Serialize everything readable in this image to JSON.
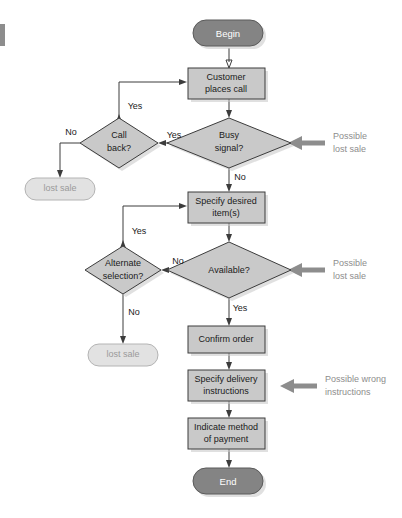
{
  "diagram": {
    "colors": {
      "process_fill": "#c9c9c9",
      "terminator_fill": "#848484",
      "lost_fill": "#e2e2e2",
      "line": "#3c3c3c",
      "annotation": "#8d8d8d"
    },
    "nodes": {
      "begin": {
        "label": "Begin",
        "type": "terminator"
      },
      "customer_places_call": {
        "label_line1": "Customer",
        "label_line2": "places call",
        "type": "process"
      },
      "busy_signal": {
        "label_line1": "Busy",
        "label_line2": "signal?",
        "type": "decision"
      },
      "call_back": {
        "label_line1": "Call",
        "label_line2": "back?",
        "type": "decision"
      },
      "lost_sale_1": {
        "label": "lost sale",
        "type": "terminator-light"
      },
      "specify_desired_items": {
        "label_line1": "Specify desired",
        "label_line2": "item(s)",
        "type": "process"
      },
      "available": {
        "label": "Available?",
        "type": "decision"
      },
      "alternate_selection": {
        "label_line1": "Alternate",
        "label_line2": "selection?",
        "type": "decision"
      },
      "lost_sale_2": {
        "label": "lost sale",
        "type": "terminator-light"
      },
      "confirm_order": {
        "label": "Confirm order",
        "type": "process"
      },
      "specify_delivery": {
        "label_line1": "Specify delivery",
        "label_line2": "instructions",
        "type": "process"
      },
      "indicate_payment": {
        "label_line1": "Indicate method",
        "label_line2": "of payment",
        "type": "process"
      },
      "end": {
        "label": "End",
        "type": "terminator"
      }
    },
    "branch_labels": {
      "call_back_yes": "Yes",
      "call_back_no": "No",
      "busy_signal_yes": "Yes",
      "busy_signal_no": "No",
      "alternate_yes": "Yes",
      "alternate_no": "No",
      "available_no": "No",
      "available_yes": "Yes"
    },
    "annotations": {
      "busy_signal_note_line1": "Possible",
      "busy_signal_note_line2": "lost sale",
      "available_note_line1": "Possible",
      "available_note_line2": "lost sale",
      "delivery_note_line1": "Possible wrong",
      "delivery_note_line2": "instructions"
    }
  }
}
